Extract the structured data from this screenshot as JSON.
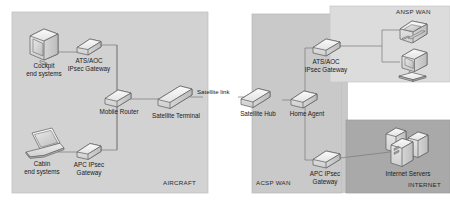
{
  "diagram": {
    "zones": [
      {
        "id": "aircraft",
        "label": "AIRCRAFT",
        "fill": "#d2d2d2",
        "stroke": "#b4b4b4"
      },
      {
        "id": "acsp-wan",
        "label": "ACSP WAN",
        "fill": "#c9c9c9",
        "stroke": "#b0b0b0"
      },
      {
        "id": "ansp-wan",
        "label": "ANSP WAN",
        "fill": "#dcdcdc",
        "stroke": "#c0c0c0"
      },
      {
        "id": "internet",
        "label": "INTERNET",
        "fill": "#a9a9a9",
        "stroke": "#999999"
      }
    ],
    "nodes": [
      {
        "id": "cockpit-end-systems",
        "icon": "crt-monitor-icon",
        "label_line1": "Cockpit",
        "label_line2": "end systems"
      },
      {
        "id": "cabin-end-systems",
        "icon": "laptop-icon",
        "label_line1": "Cabin",
        "label_line2": "end systems"
      },
      {
        "id": "ats-aoc-gateway-air",
        "icon": "router-icon",
        "label_line1": "ATS/AOC",
        "label_line2": "IPsec Gateway"
      },
      {
        "id": "apc-gateway-air",
        "icon": "router-icon",
        "label_line1": "APC IPsec",
        "label_line2": "Gateway"
      },
      {
        "id": "mobile-router",
        "icon": "router-icon",
        "label_line1": "Mobile Router",
        "label_line2": ""
      },
      {
        "id": "satellite-terminal",
        "icon": "terminal-bar-icon",
        "label_line1": "Satellite Terminal",
        "label_line2": ""
      },
      {
        "id": "satellite-hub",
        "icon": "terminal-bar-icon",
        "label_line1": "Satellite Hub",
        "label_line2": ""
      },
      {
        "id": "home-agent",
        "icon": "router-icon",
        "label_line1": "Home Agent",
        "label_line2": ""
      },
      {
        "id": "ats-aoc-gateway-gnd",
        "icon": "router-icon",
        "label_line1": "ATS/AOC",
        "label_line2": "IPsec Gateway"
      },
      {
        "id": "apc-gateway-gnd",
        "icon": "router-icon",
        "label_line1": "APC IPsec",
        "label_line2": "Gateway"
      },
      {
        "id": "internet-servers",
        "icon": "server-stack-icon",
        "label_line1": "Internet Servers",
        "label_line2": ""
      },
      {
        "id": "ansp-phone-terminal",
        "icon": "telephone-icon",
        "label_line1": "",
        "label_line2": ""
      },
      {
        "id": "ansp-workstation",
        "icon": "workstation-icon",
        "label_line1": "",
        "label_line2": ""
      }
    ],
    "links": [
      {
        "id": "cockpit-to-ats-gw",
        "label": ""
      },
      {
        "id": "ats-gw-to-router",
        "label": ""
      },
      {
        "id": "cabin-to-apc-gw",
        "label": ""
      },
      {
        "id": "apc-gw-to-router",
        "label": ""
      },
      {
        "id": "router-to-sat-term",
        "label": ""
      },
      {
        "id": "sat-term-to-sat-hub",
        "label": "Satellite link"
      },
      {
        "id": "sat-hub-to-home-agent",
        "label": ""
      },
      {
        "id": "home-agent-to-ats-gw-gnd",
        "label": ""
      },
      {
        "id": "home-agent-to-apc-gw-gnd",
        "label": ""
      },
      {
        "id": "ats-gw-gnd-to-ansp",
        "label": ""
      },
      {
        "id": "apc-gw-gnd-to-servers",
        "label": ""
      }
    ],
    "colors": {
      "line": "#8a8a8a",
      "device_fill_light": "#f0f0f0",
      "device_fill_mid": "#dcdcdc",
      "device_fill_dark": "#c2c2c2",
      "device_stroke": "#5a5a5a",
      "text": "#1c1c1c"
    }
  }
}
